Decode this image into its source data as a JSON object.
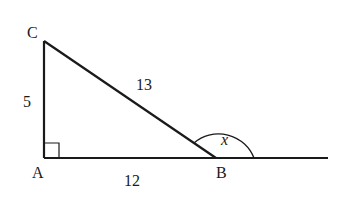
{
  "diagram": {
    "type": "right-triangle-exterior-angle",
    "vertices": {
      "A": {
        "label": "A"
      },
      "B": {
        "label": "B"
      },
      "C": {
        "label": "C"
      }
    },
    "sides": {
      "AC": {
        "label": "5"
      },
      "CB": {
        "label": "13"
      },
      "AB": {
        "label": "12"
      }
    },
    "right_angle_at": "A",
    "exterior_angle": {
      "vertex": "B",
      "label": "x"
    },
    "colors": {
      "stroke": "#1a1a1a",
      "background": "#ffffff"
    }
  }
}
